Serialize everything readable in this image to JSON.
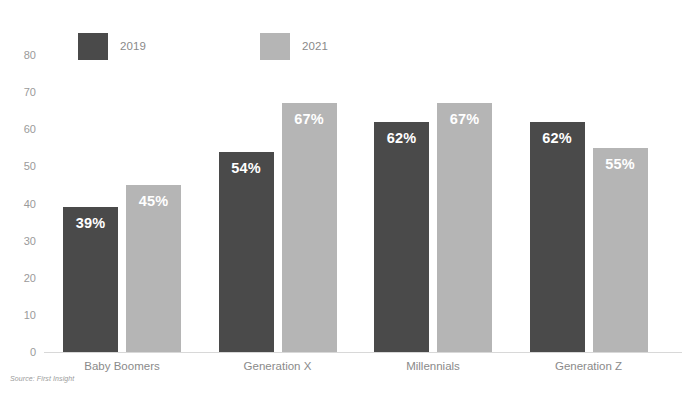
{
  "chart_data": {
    "type": "bar",
    "title": "",
    "xlabel": "",
    "ylabel": "",
    "ylim": [
      0,
      80
    ],
    "yticks": [
      0,
      10,
      20,
      30,
      40,
      50,
      60,
      70,
      80
    ],
    "grid": false,
    "legend_position": "top-left",
    "categories": [
      "Baby Boomers",
      "Generation X",
      "Millennials",
      "Generation Z"
    ],
    "series": [
      {
        "name": "2019",
        "color": "#4a4a4a",
        "values": [
          39,
          54,
          62,
          62
        ],
        "labels": [
          "39%",
          "54%",
          "62%",
          "62%"
        ]
      },
      {
        "name": "2021",
        "color": "#b5b5b5",
        "values": [
          45,
          67,
          67,
          55
        ],
        "labels": [
          "45%",
          "67%",
          "67%",
          "55%"
        ]
      }
    ],
    "annotations": {
      "source": "Source: First Insight"
    }
  }
}
